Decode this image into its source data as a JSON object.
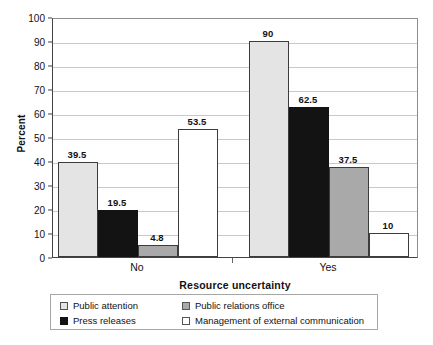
{
  "chart_data": {
    "type": "bar",
    "title": "",
    "xlabel": "Resource uncertainty",
    "ylabel": "Percent",
    "categories": [
      "No",
      "Yes"
    ],
    "ylim": [
      0,
      100
    ],
    "ytick_step": 10,
    "yticks": [
      "0",
      "10",
      "20",
      "30",
      "40",
      "50",
      "60",
      "70",
      "80",
      "90",
      "100"
    ],
    "grid": true,
    "legend_position": "below-plot",
    "series": [
      {
        "name": "Public attention",
        "color": "#e4e4e4",
        "values": [
          39.5,
          90
        ],
        "labels": [
          "39.5",
          "90"
        ]
      },
      {
        "name": "Press releases",
        "color": "#131313",
        "values": [
          19.5,
          62.5
        ],
        "labels": [
          "19.5",
          "62.5"
        ]
      },
      {
        "name": "Public relations office",
        "color": "#a9a9a9",
        "values": [
          4.8,
          37.5
        ],
        "labels": [
          "4.8",
          "37.5"
        ]
      },
      {
        "name": "Management of external communication",
        "color": "#ffffff",
        "values": [
          53.5,
          10
        ],
        "labels": [
          "53.5",
          "10"
        ]
      }
    ]
  },
  "legend": {
    "entries": [
      {
        "label": "Public attention",
        "swatch": "s0"
      },
      {
        "label": "Public relations office",
        "swatch": "s2"
      },
      {
        "label": "Press releases",
        "swatch": "s1"
      },
      {
        "label": "Management of external communication",
        "swatch": "s3"
      }
    ]
  },
  "colors": {
    "series_1": "#e4e4e4",
    "series_2": "#131313",
    "series_3": "#a9a9a9",
    "series_4": "#ffffff",
    "gridline": "#c9c9c9",
    "axis": "#444444",
    "text": "#111111"
  }
}
